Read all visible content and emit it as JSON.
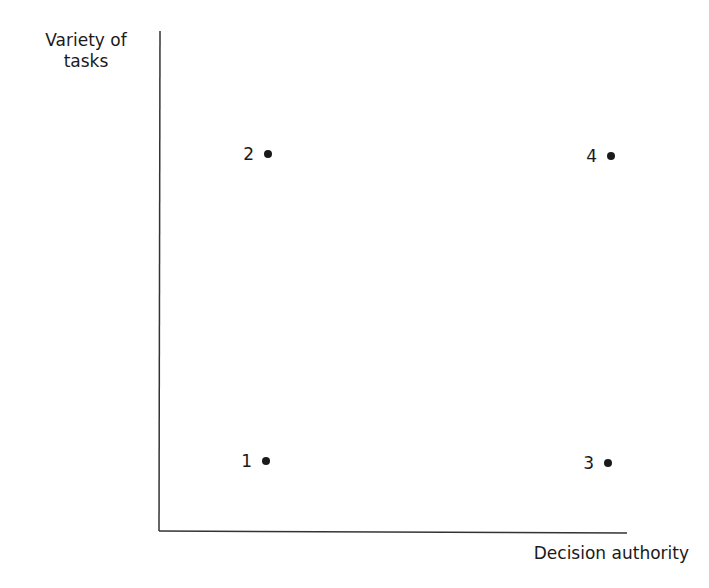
{
  "chart_data": {
    "type": "scatter",
    "title": "",
    "xlabel": "Decision authority",
    "ylabel_lines": [
      "Variety of",
      "tasks"
    ],
    "xlim": [
      0,
      1
    ],
    "ylim": [
      0,
      1
    ],
    "grid": false,
    "points": [
      {
        "label": "1",
        "x": "low",
        "y": "low"
      },
      {
        "label": "2",
        "x": "low",
        "y": "high"
      },
      {
        "label": "3",
        "x": "high",
        "y": "low"
      },
      {
        "label": "4",
        "x": "high",
        "y": "high"
      }
    ],
    "point_values": [
      {
        "label": "1",
        "x": 0.23,
        "y": 0.14
      },
      {
        "label": "2",
        "x": 0.23,
        "y": 0.75
      },
      {
        "label": "3",
        "x": 0.96,
        "y": 0.14
      },
      {
        "label": "4",
        "x": 0.97,
        "y": 0.75
      }
    ]
  },
  "colors": {
    "ink": "#1a1a1a",
    "axis": "#333333",
    "background": "#ffffff"
  }
}
